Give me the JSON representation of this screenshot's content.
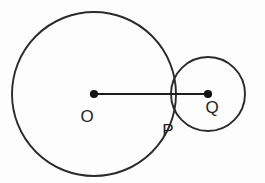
{
  "figure": {
    "background_color": "#fdfdfd",
    "stroke_color": "#2b2b2b",
    "dot_color": "#121212",
    "label_color": "#232323",
    "width": 265,
    "height": 183
  },
  "labels": {
    "center_large": "O",
    "tangent_point": "P",
    "center_small": "Q"
  },
  "chart_data": {
    "type": "diagram",
    "circles": [
      {
        "name": "large-circle",
        "center_label": "O",
        "cx": 94,
        "cy": 94,
        "r": 82
      },
      {
        "name": "small-circle",
        "center_label": "Q",
        "cx": 208,
        "cy": 94,
        "r": 37
      }
    ],
    "points": [
      {
        "label": "O",
        "x": 94,
        "y": 94,
        "marked": true
      },
      {
        "label": "P",
        "x": 175,
        "y": 94,
        "marked": false
      },
      {
        "label": "Q",
        "x": 208,
        "y": 94,
        "marked": true
      }
    ],
    "segments": [
      {
        "name": "OQ",
        "from": "O",
        "to": "Q",
        "x1": 94,
        "y1": 94,
        "x2": 208,
        "y2": 94
      }
    ],
    "label_positions": [
      {
        "label": "O",
        "x": 87,
        "y": 122
      },
      {
        "label": "P",
        "x": 168,
        "y": 136
      },
      {
        "label": "Q",
        "x": 212,
        "y": 113
      }
    ]
  }
}
